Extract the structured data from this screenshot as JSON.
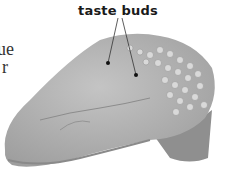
{
  "figure": {
    "label": "taste buds",
    "cropped_side_text": [
      "ue",
      "r"
    ],
    "colors": {
      "tongue": "#b5b5b5",
      "papillae": "#d6d6d6",
      "label_text": "#1a1a1a",
      "background": "#ffffff"
    }
  }
}
